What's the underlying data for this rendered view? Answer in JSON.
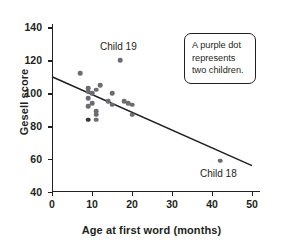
{
  "chart_data": {
    "type": "scatter",
    "title": "",
    "xlabel": "Age at first word (months)",
    "ylabel": "Gesell score",
    "xlim": [
      0,
      52
    ],
    "ylim": [
      40,
      142
    ],
    "xticks": [
      0,
      10,
      20,
      30,
      40,
      50
    ],
    "xtick_labels": [
      "0",
      "10",
      "20",
      "30",
      "40",
      "50"
    ],
    "yticks": [
      40,
      60,
      80,
      100,
      120,
      140
    ],
    "ytick_labels": [
      "40",
      "60",
      "80",
      "100",
      "120",
      "140"
    ],
    "grid": false,
    "legend": "none",
    "points": [
      {
        "x": 7,
        "y": 112,
        "double": false
      },
      {
        "x": 9,
        "y": 103,
        "double": false
      },
      {
        "x": 9,
        "y": 101,
        "double": false
      },
      {
        "x": 10,
        "y": 100,
        "double": false
      },
      {
        "x": 11,
        "y": 102,
        "double": false
      },
      {
        "x": 12,
        "y": 105,
        "double": false
      },
      {
        "x": 9,
        "y": 97,
        "double": false
      },
      {
        "x": 9,
        "y": 92,
        "double": false
      },
      {
        "x": 10,
        "y": 94,
        "double": false
      },
      {
        "x": 11,
        "y": 89,
        "double": false
      },
      {
        "x": 11,
        "y": 87,
        "double": false
      },
      {
        "x": 9,
        "y": 84,
        "double": true
      },
      {
        "x": 11,
        "y": 84,
        "double": false
      },
      {
        "x": 15,
        "y": 100,
        "double": false
      },
      {
        "x": 14,
        "y": 95,
        "double": false
      },
      {
        "x": 15,
        "y": 93,
        "double": false
      },
      {
        "x": 18,
        "y": 95,
        "double": false
      },
      {
        "x": 19,
        "y": 94,
        "double": false
      },
      {
        "x": 20,
        "y": 93,
        "double": false
      },
      {
        "x": 20,
        "y": 87,
        "double": false
      },
      {
        "x": 17,
        "y": 120,
        "double": false
      },
      {
        "x": 42,
        "y": 59,
        "double": false
      }
    ],
    "trend_line": {
      "x1": 0,
      "y1": 110,
      "x2": 50,
      "y2": 56
    },
    "annotations": [
      {
        "name": "child-19",
        "text": "Child 19",
        "x": 17,
        "y": 120
      },
      {
        "name": "child-18",
        "text": "Child 18",
        "x": 42,
        "y": 59
      }
    ],
    "callout": {
      "line1": "A purple dot",
      "line2": "represents",
      "line3": "two children."
    },
    "colors": {
      "point": "#6e6a73",
      "point_double": "#3a3340",
      "axis": "#231f20",
      "line": "#231f20",
      "background": "#ffffff"
    }
  }
}
